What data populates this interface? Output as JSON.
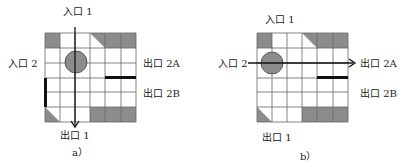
{
  "panels": [
    {
      "id": "a",
      "caption": "a）",
      "labels": {
        "entrance1": "入口 1",
        "entrance2": "入口 2",
        "exit2a": "出口 2A",
        "exit2b": "出口 2B",
        "exit1": "出口 1"
      },
      "flow": "入口 1 → 出口 1 (vertical)"
    },
    {
      "id": "b",
      "caption": "b）",
      "labels": {
        "entrance1": "入口 1",
        "entrance2": "入口 2",
        "exit2a": "出口 2A",
        "exit2b": "出口 2B",
        "exit1": "出口 1"
      },
      "flow": "入口 2 → 出口 2A (horizontal)"
    }
  ],
  "grid": {
    "rows": 6,
    "cols": 6
  },
  "colors": {
    "shade": "#8c8c8c",
    "line": "#555555",
    "bar": "#111111"
  }
}
